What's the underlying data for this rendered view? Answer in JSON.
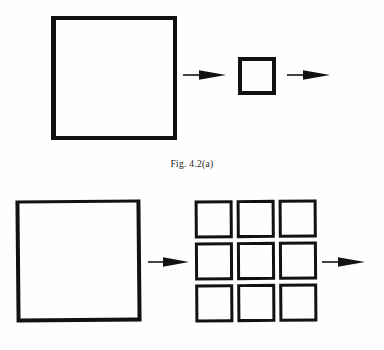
{
  "figure": {
    "page_background": "#fefefe",
    "ink_color": "#121212",
    "caption_a": "Fig. 4.2(a)",
    "panels": [
      {
        "id": "panel-a",
        "caption": "Fig. 4.2(a)",
        "description": "One large square transforms into one small square, then an arrow continues to the right",
        "shapes": [
          {
            "name": "large-square",
            "kind": "square",
            "count": 1
          },
          {
            "name": "small-square",
            "kind": "square",
            "count": 1
          }
        ],
        "arrows": [
          {
            "name": "arrow-large-to-small",
            "direction": "right"
          },
          {
            "name": "arrow-small-to-next",
            "direction": "right"
          }
        ]
      },
      {
        "id": "panel-b",
        "caption": "",
        "description": "One large square transforms into a 3 by 3 grid of nine small squares, then an arrow continues to the right",
        "shapes": [
          {
            "name": "large-square",
            "kind": "square",
            "count": 1
          },
          {
            "name": "square-grid",
            "kind": "grid",
            "rows": 3,
            "columns": 3,
            "count": 9
          }
        ],
        "arrows": [
          {
            "name": "arrow-large-to-grid",
            "direction": "right"
          },
          {
            "name": "arrow-grid-to-next",
            "direction": "right"
          }
        ]
      }
    ],
    "grid_cells": [
      {
        "row": 1,
        "col": 1
      },
      {
        "row": 1,
        "col": 2
      },
      {
        "row": 1,
        "col": 3
      },
      {
        "row": 2,
        "col": 1
      },
      {
        "row": 2,
        "col": 2
      },
      {
        "row": 2,
        "col": 3
      },
      {
        "row": 3,
        "col": 1
      },
      {
        "row": 3,
        "col": 2
      },
      {
        "row": 3,
        "col": 3
      }
    ]
  }
}
